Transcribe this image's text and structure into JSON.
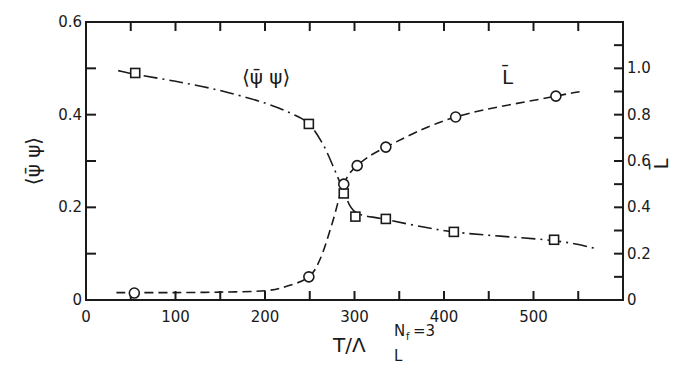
{
  "chart_data": {
    "type": "line",
    "title": "",
    "xlabel": "T/Λ_L^{N_f=3}",
    "xlabel_parts": {
      "main": "T/Λ",
      "sub": "L",
      "sup": "N",
      "sup_sub": "f",
      "sup_rest": "=3"
    },
    "ylabel_left": "⟨ψ̄ ψ⟩",
    "ylabel_right": "L̄",
    "xlim": [
      0,
      600
    ],
    "ylim_left": [
      0,
      0.6
    ],
    "ylim_right": [
      0,
      1.2
    ],
    "x_ticks": [
      0,
      100,
      200,
      300,
      400,
      500
    ],
    "x_tick_labels": [
      "0",
      "100",
      "200",
      "300",
      "400",
      "500"
    ],
    "x_minor_step": 50,
    "y_left_ticks": [
      0,
      0.2,
      0.4,
      0.6
    ],
    "y_left_tick_labels": [
      "0",
      "0.2",
      "0.4",
      "0.6"
    ],
    "y_left_minor_step": 0.1,
    "y_right_ticks": [
      0,
      0.2,
      0.4,
      0.6,
      0.8,
      1.0
    ],
    "y_right_tick_labels": [
      "0",
      "0.2",
      "0.4",
      "0.6",
      "0.8",
      "1.0"
    ],
    "y_right_minor_step": 0.1,
    "grid": false,
    "legend": "inline labels",
    "series": [
      {
        "name": "⟨ψ̄ ψ⟩",
        "axis": "left",
        "marker": "square",
        "line_style": "dash-dot",
        "x": [
          55,
          249,
          288,
          301,
          335,
          411,
          523
        ],
        "values": [
          0.49,
          0.38,
          0.23,
          0.18,
          0.175,
          0.147,
          0.13
        ],
        "curve_x": [
          36,
          55,
          100,
          150,
          200,
          230,
          249,
          265,
          278,
          288,
          301,
          335,
          411,
          523,
          570
        ],
        "curve_y": [
          0.495,
          0.487,
          0.472,
          0.452,
          0.425,
          0.402,
          0.38,
          0.335,
          0.28,
          0.235,
          0.19,
          0.174,
          0.147,
          0.128,
          0.111
        ]
      },
      {
        "name": "L̄",
        "axis": "right",
        "marker": "circle",
        "line_style": "dashed",
        "x": [
          54,
          249,
          288,
          303,
          335,
          413,
          525
        ],
        "values": [
          0.03,
          0.1,
          0.5,
          0.58,
          0.66,
          0.79,
          0.88
        ],
        "curve_x": [
          34,
          54,
          100,
          150,
          200,
          225,
          249,
          262,
          275,
          288,
          303,
          335,
          413,
          525,
          553
        ],
        "curve_y": [
          0.032,
          0.032,
          0.032,
          0.034,
          0.04,
          0.06,
          0.1,
          0.18,
          0.33,
          0.5,
          0.58,
          0.66,
          0.79,
          0.88,
          0.9
        ]
      }
    ],
    "annotations": [
      {
        "text": "⟨ψ̄ ψ⟩",
        "x": 250,
        "y_left": 0.48
      },
      {
        "text": "L̄",
        "x": 475,
        "y_right": 0.98
      }
    ]
  },
  "labels": {
    "series_psi": "⟨ψ̄ ψ⟩",
    "series_L": "L̄",
    "xlabel_main": "T/Λ",
    "xlabel_sub": "L",
    "xlabel_sup": "N",
    "xlabel_sup_sub": "f",
    "xlabel_sup_rest": "=3",
    "ylabel_left": "⟨ψ̄ ψ⟩",
    "ylabel_right": "L̄"
  },
  "colors": {
    "ink": "#1a1a1a",
    "background": "#ffffff"
  }
}
